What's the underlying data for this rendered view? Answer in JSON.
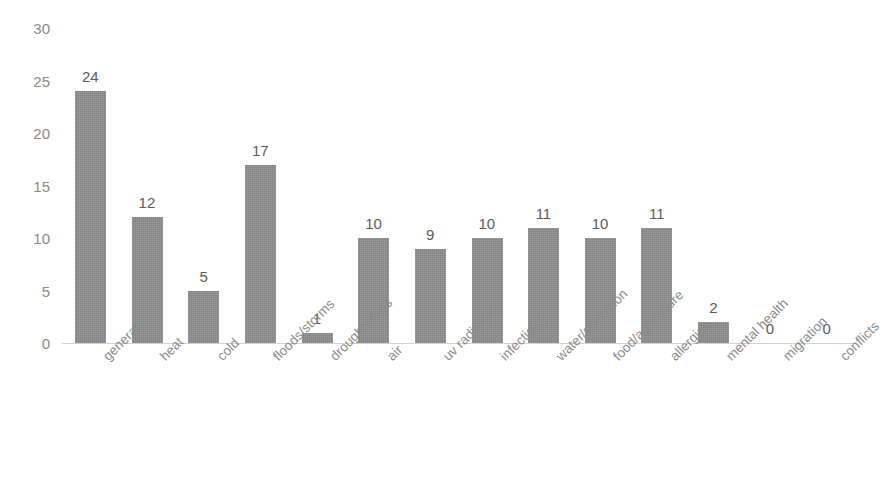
{
  "chart_data": {
    "type": "bar",
    "title": "",
    "xlabel": "",
    "ylabel": "",
    "ylim": [
      0,
      30
    ],
    "yticks": [
      30,
      25,
      20,
      15,
      10,
      5,
      0
    ],
    "grid": false,
    "legend": null,
    "bar_color": "#8e8e8e",
    "label_color": "#5b5b5b",
    "axis_text_color": "#8a8a8a",
    "axis_line_color": "#d2d2d2",
    "categories": [
      "general",
      "heat",
      "cold",
      "floods/storms",
      "droughts/fires",
      "air",
      "uv radiation",
      "infectious",
      "water/sanitation",
      "food/agriculture",
      "allergies",
      "mental health",
      "migration",
      "conflicts"
    ],
    "values": [
      24,
      12,
      5,
      17,
      1,
      10,
      9,
      10,
      11,
      10,
      11,
      2,
      0,
      0
    ],
    "value_labels": [
      "24",
      "12",
      "5",
      "17",
      "1",
      "10",
      "9",
      "10",
      "11",
      "10",
      "11",
      "2",
      "0",
      "0"
    ]
  }
}
